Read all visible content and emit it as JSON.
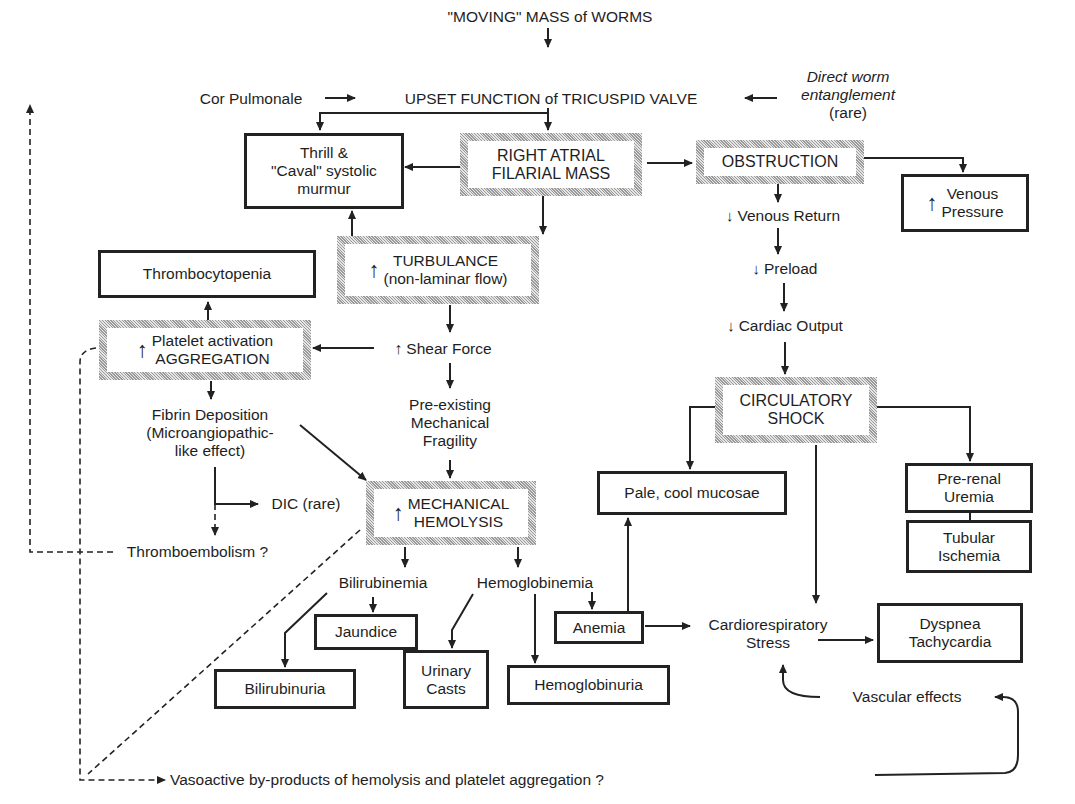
{
  "diagram": {
    "nodes": {
      "moving_mass": "\"MOVING\" MASS of WORMS",
      "cor_pulmonale": "Cor Pulmonale",
      "upset_function": "UPSET FUNCTION of TRICUSPID VALVE",
      "direct_worm": [
        "Direct worm",
        "entanglement",
        "(rare)"
      ],
      "thrill": [
        "Thrill &",
        "\"Caval\" systolic",
        "murmur"
      ],
      "right_atrial": [
        "RIGHT ATRIAL",
        "FILARIAL MASS"
      ],
      "obstruction": "OBSTRUCTION",
      "venous_pressure": [
        "Venous",
        "Pressure"
      ],
      "venous_return": "Venous Return",
      "thrombocytopenia": "Thrombocytopenia",
      "turbulance": [
        "TURBULANCE",
        "(non-laminar flow)"
      ],
      "preload": "Preload",
      "platelet": [
        "Platelet activation",
        "AGGREGATION"
      ],
      "shear_force": "Shear Force",
      "cardiac_output": "Cardiac Output",
      "fibrin": [
        "Fibrin Deposition",
        "(Microangiopathic-",
        "like effect)"
      ],
      "pre_existing": [
        "Pre-existing",
        "Mechanical",
        "Fragility"
      ],
      "circulatory_shock": [
        "CIRCULATORY",
        "SHOCK"
      ],
      "dic": "DIC (rare)",
      "mechanical_hemolysis": [
        "MECHANICAL",
        "HEMOLYSIS"
      ],
      "pale_mucosae": "Pale, cool mucosae",
      "pre_renal": [
        "Pre-renal",
        "Uremia"
      ],
      "tubular": [
        "Tubular",
        "Ischemia"
      ],
      "thromboembolism": "Thromboembolism ?",
      "bilirubinemia": "Bilirubinemia",
      "hemoglobinemia": "Hemoglobinemia",
      "jaundice": "Jaundice",
      "anemia": "Anemia",
      "cardiorespiratory": [
        "Cardiorespiratory",
        "Stress"
      ],
      "dyspnea": [
        "Dyspnea",
        "Tachycardia"
      ],
      "bilirubinuria": "Bilirubinuria",
      "urinary_casts": [
        "Urinary",
        "Casts"
      ],
      "hemoglobinuria": "Hemoglobinuria",
      "vascular_effects": "Vascular effects",
      "vasoactive": "Vasoactive by-products of hemolysis and platelet aggregation ?"
    },
    "symbols": {
      "increase": "↑",
      "decrease": "↓"
    },
    "colors": {
      "ink": "#1e1e1e",
      "hatch": "#9a9a9a",
      "background": "#ffffff"
    }
  }
}
